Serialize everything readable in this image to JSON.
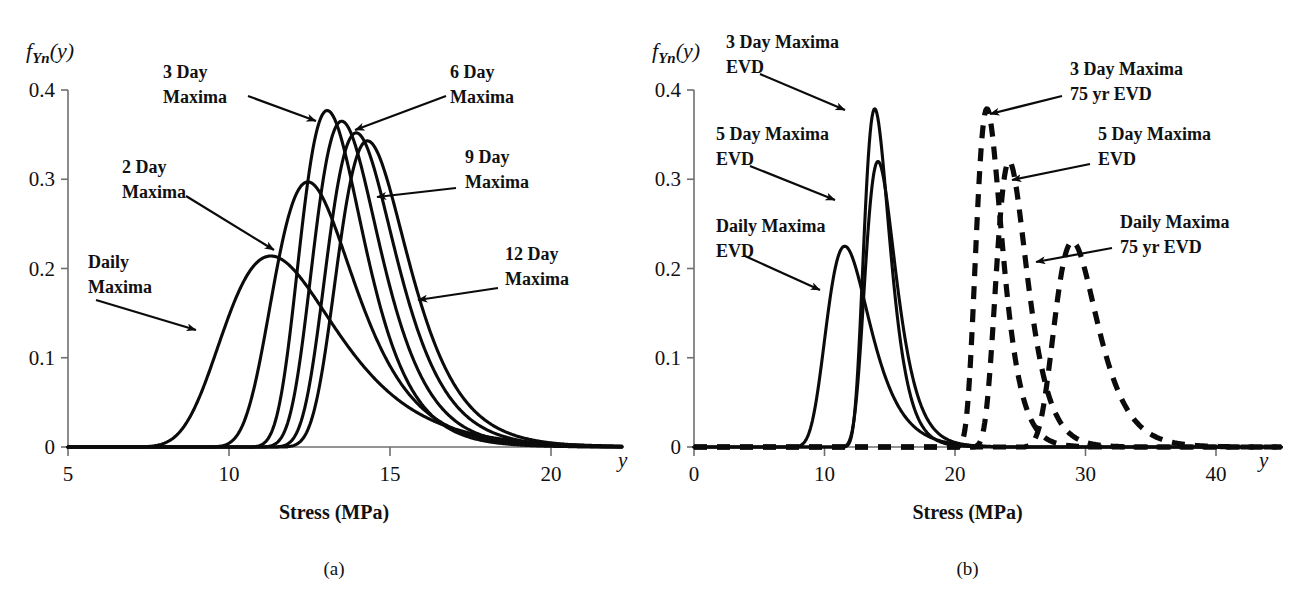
{
  "figure": {
    "panels": [
      {
        "id": "a",
        "caption": "(a)",
        "y_axis": {
          "label": "f",
          "label_sub": "Yn",
          "label_arg": "(y)",
          "ticks": [
            "0",
            "0.1",
            "0.2",
            "0.3",
            "0.4"
          ],
          "tick_values": [
            0,
            0.1,
            0.2,
            0.3,
            0.4
          ],
          "min": 0,
          "max": 0.4
        },
        "x_axis": {
          "title": "Stress (MPa)",
          "variable": "y",
          "ticks": [
            "5",
            "10",
            "15",
            "20"
          ],
          "tick_values": [
            5,
            10,
            15,
            20
          ],
          "min": 5,
          "max": 22.2
        },
        "annotations": [
          {
            "name": "daily-maxima",
            "lines": [
              "Daily",
              "Maxima"
            ],
            "x": 88,
            "y": 268
          },
          {
            "name": "2-day-maxima",
            "lines": [
              "2 Day",
              "Maxima"
            ],
            "x": 122,
            "y": 173
          },
          {
            "name": "3-day-maxima",
            "lines": [
              "3 Day",
              "Maxima"
            ],
            "x": 163,
            "y": 78
          },
          {
            "name": "6-day-maxima",
            "lines": [
              "6 Day",
              "Maxima"
            ],
            "x": 450,
            "y": 78
          },
          {
            "name": "9-day-maxima",
            "lines": [
              "9 Day",
              "Maxima"
            ],
            "x": 465,
            "y": 163
          },
          {
            "name": "12-day-maxima",
            "lines": [
              "12 Day",
              "Maxima"
            ],
            "x": 505,
            "y": 260
          }
        ]
      },
      {
        "id": "b",
        "caption": "(b)",
        "y_axis": {
          "label": "f",
          "label_sub": "Yn",
          "label_arg": "(y)",
          "ticks": [
            "0",
            "0.1",
            "0.2",
            "0.3",
            "0.4"
          ],
          "tick_values": [
            0,
            0.1,
            0.2,
            0.3,
            0.4
          ],
          "min": 0,
          "max": 0.4
        },
        "x_axis": {
          "title": "Stress (MPa)",
          "variable": "y",
          "ticks": [
            "0",
            "10",
            "20",
            "30",
            "40"
          ],
          "tick_values": [
            0,
            10,
            20,
            30,
            40
          ],
          "min": 0,
          "max": 45
        },
        "annotations": [
          {
            "name": "daily-maxima-evd",
            "lines": [
              "Daily Maxima",
              "EVD"
            ],
            "x": 716,
            "y": 232
          },
          {
            "name": "5-day-maxima-evd",
            "lines": [
              "5 Day Maxima",
              "EVD"
            ],
            "x": 716,
            "y": 140
          },
          {
            "name": "3-day-maxima-evd",
            "lines": [
              "3 Day Maxima",
              "EVD"
            ],
            "x": 726,
            "y": 48
          },
          {
            "name": "3-day-maxima-75yr-evd",
            "lines": [
              "3 Day Maxima",
              "75 yr EVD"
            ],
            "x": 1070,
            "y": 75
          },
          {
            "name": "5-day-maxima-evd-right",
            "lines": [
              "5 Day Maxima",
              "EVD"
            ],
            "x": 1098,
            "y": 140
          },
          {
            "name": "daily-maxima-75yr-evd",
            "lines": [
              "Daily Maxima",
              "75 yr EVD"
            ],
            "x": 1120,
            "y": 228
          }
        ]
      }
    ]
  },
  "chart_data": [
    {
      "type": "line",
      "panel": "a",
      "title": "Extreme value distributions of n-day maxima stress",
      "xlabel": "Stress (MPa)",
      "ylabel": "f_Yn(y)",
      "xlim": [
        5,
        22.2
      ],
      "ylim": [
        0,
        0.4
      ],
      "xticks": [
        5,
        10,
        15,
        20
      ],
      "yticks": [
        0,
        0.1,
        0.2,
        0.3,
        0.4
      ],
      "grid": false,
      "legend": "annotations-with-arrows",
      "distribution": "gumbel",
      "series": [
        {
          "name": "Daily Maxima",
          "linestyle": "solid",
          "mode": 11.3,
          "scale": 1.72,
          "peak": 0.214
        },
        {
          "name": "2 Day Maxima",
          "linestyle": "solid",
          "mode": 12.45,
          "scale": 1.24,
          "peak": 0.297
        },
        {
          "name": "3 Day Maxima",
          "linestyle": "solid",
          "mode": 13.05,
          "scale": 0.975,
          "peak": 0.377
        },
        {
          "name": "6 Day Maxima",
          "linestyle": "solid",
          "mode": 13.5,
          "scale": 1.01,
          "peak": 0.365
        },
        {
          "name": "9 Day Maxima",
          "linestyle": "solid",
          "mode": 13.95,
          "scale": 1.045,
          "peak": 0.352
        },
        {
          "name": "12 Day Maxima",
          "linestyle": "solid",
          "mode": 14.3,
          "scale": 1.075,
          "peak": 0.343
        }
      ]
    },
    {
      "type": "line",
      "panel": "b",
      "title": "Daily / 3 day / 5 day maxima EVD and 75 yr EVD",
      "xlabel": "Stress (MPa)",
      "ylabel": "f_Yn(y)",
      "xlim": [
        0,
        45
      ],
      "ylim": [
        0,
        0.4
      ],
      "xticks": [
        0,
        10,
        20,
        30,
        40
      ],
      "yticks": [
        0,
        0.1,
        0.2,
        0.3,
        0.4
      ],
      "grid": false,
      "legend": "annotations-with-arrows",
      "distribution": "gumbel",
      "series": [
        {
          "name": "Daily Maxima EVD",
          "linestyle": "solid",
          "mode": 11.55,
          "scale": 1.635,
          "peak": 0.225
        },
        {
          "name": "3 Day Maxima EVD",
          "linestyle": "solid",
          "mode": 13.85,
          "scale": 0.97,
          "peak": 0.379
        },
        {
          "name": "5 Day Maxima EVD",
          "linestyle": "solid",
          "mode": 14.1,
          "scale": 1.15,
          "peak": 0.32
        },
        {
          "name": "3 Day Maxima 75 yr EVD",
          "linestyle": "dashed",
          "mode": 22.45,
          "scale": 0.97,
          "peak": 0.379
        },
        {
          "name": "5 Day Maxima 75 yr EVD",
          "linestyle": "dashed",
          "mode": 24.15,
          "scale": 1.15,
          "peak": 0.32
        },
        {
          "name": "Daily Maxima 75 yr EVD",
          "linestyle": "dashed",
          "mode": 29.0,
          "scale": 1.6,
          "peak": 0.23
        }
      ]
    }
  ]
}
